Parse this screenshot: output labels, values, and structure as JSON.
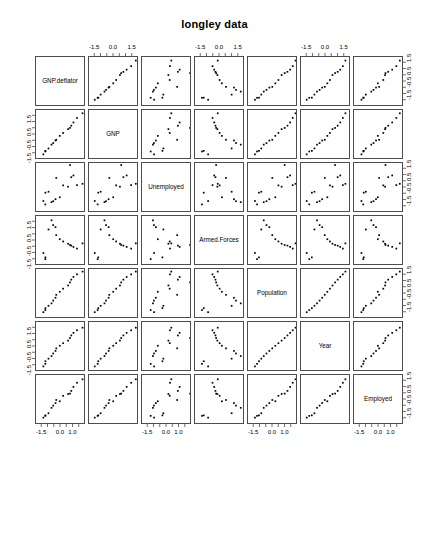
{
  "title": "longley data",
  "chart_data": {
    "type": "scatter",
    "title": "longley data",
    "subtitle": "",
    "xlabel": "",
    "ylabel": "",
    "plot_kind": "scatterplot-matrix",
    "n_variables": 7,
    "n_observations": 16,
    "variables": [
      "GNP.deflator",
      "GNP",
      "Unemployed",
      "Armed.Forces",
      "Population",
      "Year",
      "Employed"
    ],
    "axis_range": [
      -2.0,
      2.0
    ],
    "grid": false,
    "legend": "none",
    "point_color": "#000000",
    "panel_border_color": "#4d4d4d",
    "tick_labels_top": [
      "-1.5",
      "0.0",
      "1.5"
    ],
    "tick_labels_bottom": [
      "-1.5",
      "0.0",
      "1.0"
    ],
    "tick_labels_left": [
      "-1.5",
      "-0.5",
      "0.5",
      "1.5"
    ],
    "tick_labels_right": [
      "-1.5",
      "-0.5",
      "0.5",
      "1.5"
    ],
    "tick_values": [
      -1.5,
      -0.5,
      0.5,
      1.5
    ],
    "tick_values_top": [
      -1.5,
      0.0,
      1.5
    ],
    "tick_values_bottom": [
      -1.5,
      0.0,
      1.0
    ],
    "axis_label_columns_top": [
      2,
      4,
      6
    ],
    "axis_label_columns_bottom": [
      1,
      3,
      5,
      7
    ],
    "axis_label_rows_left": [
      2,
      4,
      6
    ],
    "axis_label_rows_right": [
      1,
      3,
      5,
      7
    ],
    "note": "Values are standardized (z-scores) for each of the seven longley variables across 16 yearly observations, 1947-1962.",
    "data": {
      "GNP.deflator": [
        -1.4138,
        -1.2588,
        -1.2504,
        -1.0031,
        -0.7624,
        -0.6254,
        -0.4428,
        -0.3836,
        -0.1033,
        0.1655,
        0.5616,
        0.7163,
        0.8184,
        0.9918,
        1.2716,
        1.7183
      ],
      "GNP": [
        -1.5434,
        -1.3132,
        -1.2633,
        -1.0715,
        -0.7667,
        -0.6418,
        -0.4364,
        -0.3767,
        -0.0657,
        0.1686,
        0.4711,
        0.5717,
        0.7489,
        1.0079,
        1.3681,
        1.7424
      ],
      "Unemployed": [
        -1.0374,
        -1.3086,
        -0.3704,
        -0.2946,
        -1.1295,
        -1.0526,
        -0.8934,
        0.8103,
        -0.7374,
        0.2123,
        0.1089,
        1.8428,
        0.8668,
        1.0083,
        0.2344,
        0.34
      ],
      "Armed.Forces": [
        -0.9553,
        -1.4464,
        -1.3062,
        0.9264,
        1.6568,
        1.2743,
        1.1105,
        0.4716,
        0.1459,
        -0.0333,
        -0.2137,
        -0.3134,
        -0.3668,
        -0.4664,
        -0.6023,
        -0.1857
      ],
      "Population": [
        -1.4493,
        -1.2815,
        -1.1271,
        -0.9389,
        -0.7452,
        -0.5244,
        -0.296,
        -0.0596,
        0.182,
        0.4293,
        0.6862,
        0.9305,
        1.1526,
        1.3675,
        1.5745,
        1.7978
      ],
      "Year": [
        -1.5492,
        -1.3426,
        -1.1359,
        -0.9293,
        -0.7226,
        -0.516,
        -0.3093,
        -0.1031,
        0.1031,
        0.3093,
        0.516,
        0.7226,
        0.9293,
        1.1359,
        1.3426,
        1.5492
      ],
      "Employed": [
        -1.4069,
        -1.2659,
        -1.2248,
        -1.0556,
        -0.6232,
        -0.4436,
        -0.2409,
        0.0046,
        -0.0978,
        0.3385,
        0.4832,
        0.5149,
        0.7337,
        1.0518,
        1.3818,
        1.6604
      ]
    }
  }
}
